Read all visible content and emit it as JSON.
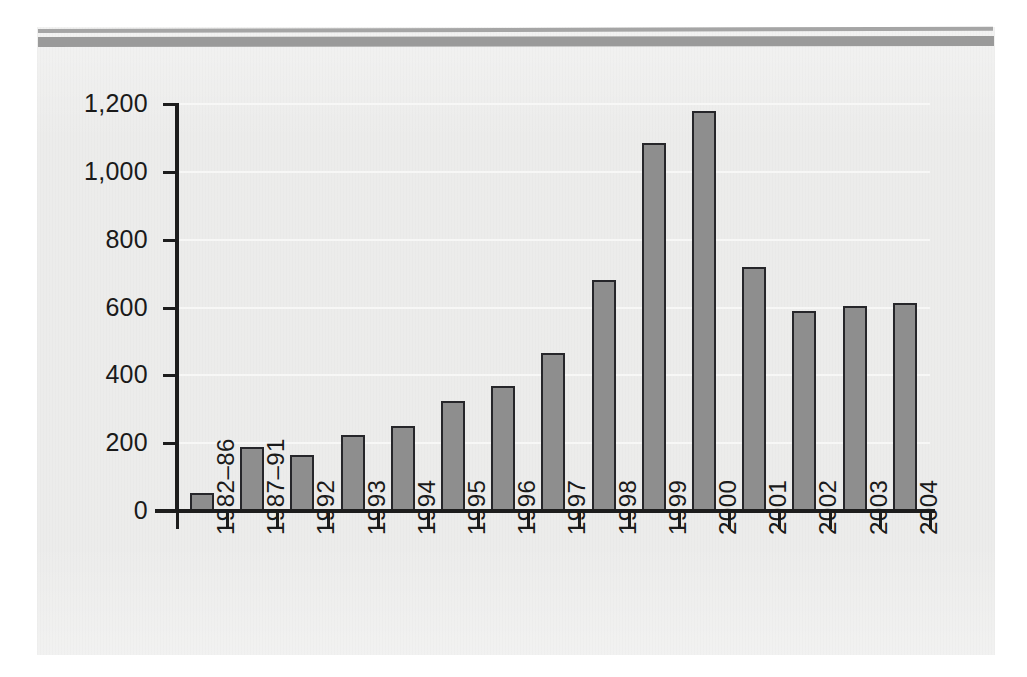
{
  "figure": {
    "background_color": "#ffffff",
    "panel_color": "#ececeb",
    "band_color": "#9a9a9a",
    "bar_fill": "#8e8e8e",
    "bar_stroke": "#26262a",
    "gridline_color": "#f7f7f6",
    "axis_color": "#1d1d1d"
  },
  "chart_data": {
    "type": "bar",
    "title": "",
    "subtitle": "",
    "xlabel": "",
    "ylabel": "",
    "categories": [
      "1982–86",
      "1987–91",
      "1992",
      "1993",
      "1994",
      "1995",
      "1996",
      "1997",
      "1998",
      "1999",
      "2000",
      "2001",
      "2002",
      "2003",
      "2004"
    ],
    "values": [
      53,
      189,
      165,
      224,
      251,
      325,
      368,
      467,
      680,
      1085,
      1178,
      718,
      590,
      605,
      612
    ],
    "ylim": [
      0,
      1200
    ],
    "ytick_values": [
      0,
      200,
      400,
      600,
      800,
      1000,
      1200
    ],
    "ytick_labels": [
      "0",
      "200",
      "400",
      "600",
      "800",
      "1,000",
      "1,200"
    ],
    "grid": true,
    "grid_axis": "y",
    "legend": false,
    "legend_position": "none",
    "annotations": []
  }
}
